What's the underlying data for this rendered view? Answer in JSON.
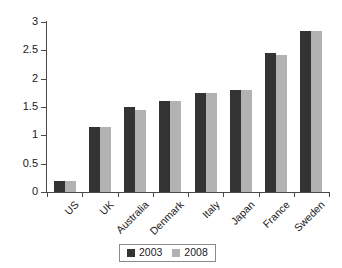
{
  "chart_data": {
    "type": "bar",
    "title": "",
    "subtitle": "",
    "xlabel": "",
    "ylabel": "",
    "categories": [
      "US",
      "UK",
      "Australia",
      "Denmark",
      "Italy",
      "Japan",
      "France",
      "Sweden"
    ],
    "series": [
      {
        "name": "2003",
        "color": "#333333",
        "values": [
          0.2,
          1.15,
          1.5,
          1.6,
          1.75,
          1.8,
          2.46,
          2.85
        ]
      },
      {
        "name": "2008",
        "color": "#b2b2b2",
        "values": [
          0.2,
          1.15,
          1.45,
          1.6,
          1.75,
          1.8,
          2.42,
          2.85
        ]
      }
    ],
    "ylim": [
      0,
      3
    ],
    "yticks": [
      "0",
      "0.5",
      "1",
      "1.5",
      "2",
      "2.5",
      "3"
    ],
    "ytick_values": [
      0,
      0.5,
      1,
      1.5,
      2,
      2.5,
      3
    ],
    "grid": false,
    "legend_position": "bottom",
    "legend_entries": [
      "2003",
      "2008"
    ],
    "annotations": []
  }
}
